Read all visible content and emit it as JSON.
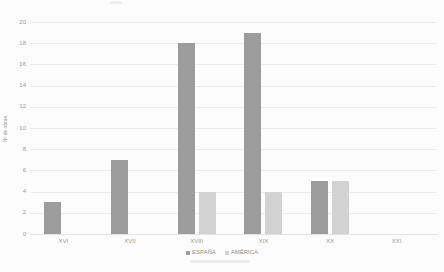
{
  "chart_data": {
    "type": "bar",
    "title": "",
    "categories": [
      "XVI",
      "XVII",
      "XVIII",
      "XIX",
      "XX",
      "XXI"
    ],
    "series": [
      {
        "name": "ESPAÑA",
        "color": "#9c9c9c",
        "values": [
          3,
          7,
          18,
          19,
          5,
          0
        ]
      },
      {
        "name": "AMÉRICA",
        "color": "#d2d2d2",
        "values": [
          0,
          0,
          4,
          4,
          5,
          0
        ]
      }
    ],
    "xlabel": "",
    "ylabel": "Nº de obras",
    "ylim": [
      0,
      20
    ],
    "ytick_step": 2,
    "yticks": [
      0,
      2,
      4,
      6,
      8,
      10,
      12,
      14,
      16,
      18,
      20
    ],
    "grid": true,
    "legend_position": "bottom-center",
    "background_color": "#fcfcfc",
    "gridline_color": "#ececec",
    "text_color": "#9a9a9a"
  },
  "legend": {
    "items": [
      {
        "label": "ESPAÑA",
        "color": "#9c9c9c"
      },
      {
        "label": "AMÉRICA",
        "color": "#d2d2d2"
      }
    ]
  }
}
